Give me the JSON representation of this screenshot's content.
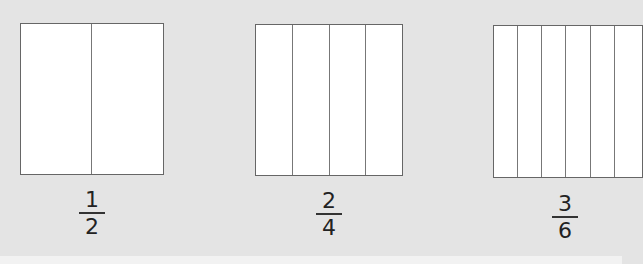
{
  "diagram": {
    "models": [
      {
        "id": "half",
        "parts": 2,
        "numerator": "1",
        "denominator": "2"
      },
      {
        "id": "two-fourths",
        "parts": 4,
        "numerator": "2",
        "denominator": "4"
      },
      {
        "id": "three-sixths",
        "parts": 6,
        "numerator": "3",
        "denominator": "6"
      }
    ]
  },
  "colors": {
    "background": "#e4e4e4",
    "rect_fill": "#ffffff",
    "rect_stroke": "#666666",
    "text": "#222222"
  }
}
